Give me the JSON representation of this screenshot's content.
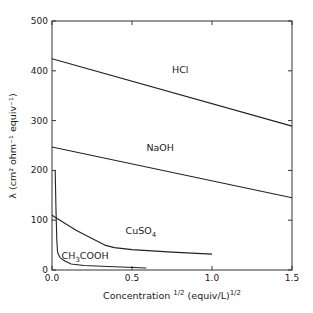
{
  "chart_data": {
    "type": "line",
    "title": "",
    "xlabel": "Concentration",
    "xlabel_sup": "1/2",
    "xlabel_units": "(equiv/L)",
    "xlabel_units_sup": "1/2",
    "ylabel": "λ (cm² ohm⁻¹ equiv⁻¹)",
    "xlim": [
      0,
      1.5
    ],
    "ylim": [
      0,
      500
    ],
    "xticks": [
      "0.0",
      "0.5",
      "1.0",
      "1.5"
    ],
    "yticks": [
      "0",
      "100",
      "200",
      "300",
      "400",
      "500"
    ],
    "grid": false,
    "legend": "inline labels",
    "series": [
      {
        "name": "HCl",
        "label": "HCl",
        "label_pos": [
          0.75,
          395
        ],
        "points": [
          [
            0.0,
            424
          ],
          [
            1.5,
            289
          ]
        ]
      },
      {
        "name": "NaOH",
        "label": "NaOH",
        "label_pos": [
          0.59,
          238
        ],
        "points": [
          [
            0.0,
            247
          ],
          [
            1.5,
            145
          ]
        ]
      },
      {
        "name": "CuSO4",
        "label": "CuSO",
        "label_sub": "4",
        "label_pos": [
          0.46,
          72
        ],
        "points": [
          [
            0.0,
            110
          ],
          [
            0.05,
            100
          ],
          [
            0.15,
            80
          ],
          [
            0.25,
            63
          ],
          [
            0.33,
            50
          ],
          [
            0.39,
            45
          ],
          [
            0.5,
            41
          ],
          [
            0.75,
            36
          ],
          [
            1.0,
            32
          ]
        ]
      },
      {
        "name": "CH3COOH",
        "label": "CH",
        "label_sub": "3",
        "label_tail": "COOH",
        "label_pos": [
          0.06,
          22
        ],
        "points": [
          [
            0.02,
            200
          ],
          [
            0.025,
            120
          ],
          [
            0.03,
            60
          ],
          [
            0.035,
            35
          ],
          [
            0.05,
            25
          ],
          [
            0.08,
            18
          ],
          [
            0.12,
            12
          ],
          [
            0.2,
            9
          ],
          [
            0.35,
            7
          ],
          [
            0.59,
            4
          ]
        ]
      }
    ]
  }
}
